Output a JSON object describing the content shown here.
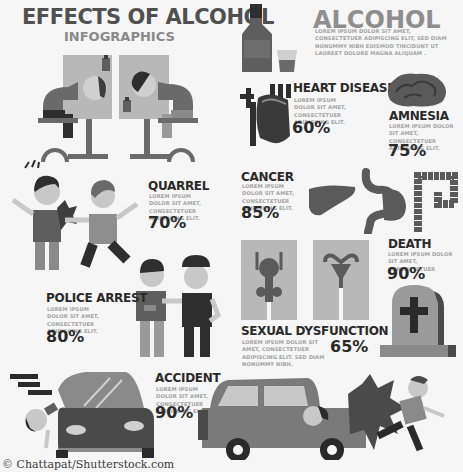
{
  "header": {
    "title": "EFFECTS OF ALCOHOL",
    "subtitle": "INFOGRAPHICS"
  },
  "alcohol": {
    "title": "ALCOHOL",
    "description": "LOREM IPSUM DOLOR SIT AMET, CONSECTETUER ADIPISCING ELIT, SED DIAM NONUMMY NIBH EUISMOD TINCIDUNT UT LAOREET DOLORE MAGNA ALIQUAM ."
  },
  "effects": [
    {
      "name": "HEART DISEASE",
      "description": "LOREM IPSUM DOLOR SIT AMET, CONSECTETUER ADIPISCING ELIT.",
      "percent": "60%",
      "icon": "heart-icon"
    },
    {
      "name": "AMNESIA",
      "description": "LOREM IPSUM DOLOR SIT AMET, CONSECTETUER ADIPISCING ELIT.",
      "percent": "75%",
      "icon": "brain-icon"
    },
    {
      "name": "QUARREL",
      "description": "LOREM IPSUM DOLOR SIT AMET, CONSECTETUER ADIPISCING ELIT.",
      "percent": "70%",
      "icon": "fighting-men-icon"
    },
    {
      "name": "CANCER",
      "description": "LOREM IPSUM DOLOR SIT AMET, CONSECTETUER ADIPISCING ELIT.",
      "percent": "85%",
      "icon": "organs-icon"
    },
    {
      "name": "DEATH",
      "description": "LOREM IPSUM DOLOR SIT AMET, CONSECTETUER",
      "percent": "90%",
      "icon": "tombstone-icon"
    },
    {
      "name": "POLICE ARREST",
      "description": "LOREM IPSUM DOLOR SIT AMET, CONSECTETUER ADIPISCING ELIT.",
      "percent": "80%",
      "icon": "police-arrest-icon"
    },
    {
      "name": "SEXUAL DYSFUNCTION",
      "description": "LOREM IPSUM DOLOR SIT AMET, CONSECTETUER ADIPISCING ELIT. SED DIAM NONUMMY NIBH.",
      "percent": "65%",
      "icon": "reproductive-organs-icon"
    },
    {
      "name": "ACCIDENT",
      "description": "LOREM IPSUM DOLOR SIT AMET, CONSECTETUER ADIPISCING ELIT.",
      "percent": "90%",
      "icon": "car-accident-icon"
    }
  ],
  "credit": "© Chattapat/Shutterstock.com",
  "colors": {
    "background": "#f6f6f6",
    "dark": "#2a2a2a",
    "mid": "#6a6a6a",
    "light": "#b5b5b5"
  }
}
